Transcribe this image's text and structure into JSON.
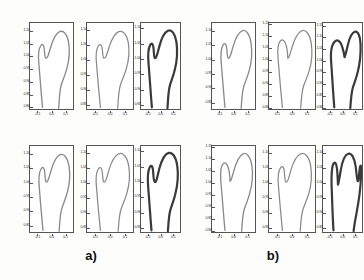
{
  "figure": {
    "type": "scientific-figure",
    "background_color": "#ffffff",
    "axis_color": "#555555"
  },
  "groups": [
    {
      "id": "a",
      "caption": "a)",
      "panels": [
        {
          "id": "a-r1-c1",
          "line_color": "#8a8a8a",
          "line_width": 0.6,
          "xticks": [
            "-0.1",
            "0.0",
            "0.1"
          ],
          "xtick_values": [
            -0.1,
            0.0,
            0.1
          ],
          "yticks": [
            "0.80",
            "0.85",
            "0.90",
            "0.95",
            "1.00",
            "1.05",
            "1.10"
          ],
          "ytick_values": [
            0.8,
            0.85,
            0.9,
            0.95,
            1.0,
            1.05,
            1.1
          ],
          "xlim": [
            -0.16,
            0.16
          ],
          "ylim": [
            0.79,
            1.135
          ],
          "ylabels_side": "left"
        },
        {
          "id": "a-r1-c2",
          "line_color": "#8a8a8a",
          "line_width": 0.6,
          "xticks": [
            "-0.1",
            "0.0",
            "0.1"
          ],
          "xtick_values": [
            -0.1,
            0.0,
            0.1
          ],
          "yticks": [
            "0.85",
            "0.90",
            "0.95",
            "1.00",
            "1.05",
            "1.10"
          ],
          "ytick_values": [
            0.85,
            0.9,
            0.95,
            1.0,
            1.05,
            1.1
          ],
          "xlim": [
            -0.16,
            0.16
          ],
          "ylim": [
            0.835,
            1.125
          ],
          "ylabels_side": "left"
        },
        {
          "id": "a-r1-c3",
          "line_color": "#3a3a3a",
          "line_width": 0.9,
          "xticks": [
            "-0.1",
            "0.0",
            "0.1"
          ],
          "xtick_values": [
            -0.1,
            0.0,
            0.1
          ],
          "yticks": [
            "0.85",
            "0.90",
            "0.95",
            "1.00",
            "1.05",
            "1.10"
          ],
          "ytick_values": [
            0.85,
            0.9,
            0.95,
            1.0,
            1.05,
            1.1
          ],
          "xlim": [
            -0.16,
            0.16
          ],
          "ylim": [
            0.835,
            1.12
          ],
          "ylabels_side": "left"
        },
        {
          "id": "a-r2-c1",
          "line_color": "#8a8a8a",
          "line_width": 0.6,
          "xticks": [
            "-0.1",
            "0.0",
            "0.1"
          ],
          "xtick_values": [
            -0.1,
            0.0,
            0.1
          ],
          "yticks": [
            "0.85",
            "0.90",
            "0.95",
            "1.00",
            "1.05",
            "1.10"
          ],
          "ytick_values": [
            0.85,
            0.9,
            0.95,
            1.0,
            1.05,
            1.1
          ],
          "xlim": [
            -0.16,
            0.16
          ],
          "ylim": [
            0.825,
            1.13
          ],
          "ylabels_side": "left"
        },
        {
          "id": "a-r2-c2",
          "line_color": "#8a8a8a",
          "line_width": 0.6,
          "xticks": [
            "-0.1",
            "0.0",
            "0.1"
          ],
          "xtick_values": [
            -0.1,
            0.0,
            0.1
          ],
          "yticks": [
            "0.85",
            "0.90",
            "0.95",
            "1.00",
            "1.05",
            "1.10"
          ],
          "ytick_values": [
            0.85,
            0.9,
            0.95,
            1.0,
            1.05,
            1.1
          ],
          "xlim": [
            -0.16,
            0.16
          ],
          "ylim": [
            0.835,
            1.125
          ],
          "ylabels_side": "left"
        },
        {
          "id": "a-r2-c3",
          "line_color": "#3a3a3a",
          "line_width": 0.9,
          "xticks": [
            "-0.1",
            "0.0",
            "0.1"
          ],
          "xtick_values": [
            -0.1,
            0.0,
            0.1
          ],
          "yticks": [
            "0.85",
            "0.90",
            "0.95",
            "1.00",
            "1.05",
            "1.10"
          ],
          "ytick_values": [
            0.85,
            0.9,
            0.95,
            1.0,
            1.05,
            1.1
          ],
          "xlim": [
            -0.16,
            0.16
          ],
          "ylim": [
            0.835,
            1.12
          ],
          "ylabels_side": "left"
        }
      ]
    },
    {
      "id": "b",
      "caption": "b)",
      "panels": [
        {
          "id": "b-r1-c1",
          "line_color": "#8a8a8a",
          "line_width": 0.6,
          "xticks": [
            "-0.1",
            "0.0",
            "0.1"
          ],
          "xtick_values": [
            -0.1,
            0.0,
            0.1
          ],
          "yticks": [
            "0.85",
            "0.90",
            "0.95",
            "1.00",
            "1.05",
            "1.10"
          ],
          "ytick_values": [
            0.85,
            0.9,
            0.95,
            1.0,
            1.05,
            1.1
          ],
          "xlim": [
            -0.16,
            0.16
          ],
          "ylim": [
            0.825,
            1.13
          ],
          "ylabels_side": "left"
        },
        {
          "id": "b-r1-c2",
          "line_color": "#8a8a8a",
          "line_width": 0.6,
          "xticks": [
            "-0.1",
            "0.0",
            "0.1"
          ],
          "xtick_values": [
            -0.1,
            0.0,
            0.1
          ],
          "yticks": [
            "0.80",
            "0.85",
            "0.90",
            "0.95",
            "1.00",
            "1.05",
            "1.10",
            "1.15"
          ],
          "ytick_values": [
            0.8,
            0.85,
            0.9,
            0.95,
            1.0,
            1.05,
            1.1,
            1.15
          ],
          "xlim": [
            -0.16,
            0.16
          ],
          "ylim": [
            0.79,
            1.16
          ],
          "ylabels_side": "left"
        },
        {
          "id": "b-r1-c3",
          "line_color": "#3a3a3a",
          "line_width": 0.9,
          "xticks": [
            "-0.1",
            "0.0",
            "0.1"
          ],
          "xtick_values": [
            -0.1,
            0.0,
            0.1
          ],
          "yticks": [
            "0.80",
            "0.85",
            "0.90",
            "0.95",
            "1.00",
            "1.05",
            "1.10",
            "1.15"
          ],
          "ytick_values": [
            0.8,
            0.85,
            0.9,
            0.95,
            1.0,
            1.05,
            1.1,
            1.15
          ],
          "xlim": [
            -0.16,
            0.16
          ],
          "ylim": [
            0.79,
            1.165
          ],
          "ylabels_side": "left"
        },
        {
          "id": "b-r2-c1",
          "line_color": "#8a8a8a",
          "line_width": 0.6,
          "xticks": [
            "-0.1",
            "0.0",
            "0.1"
          ],
          "xtick_values": [
            -0.1,
            0.0,
            0.1
          ],
          "yticks": [
            "0.80",
            "0.85",
            "0.90",
            "0.95",
            "1.00",
            "1.05",
            "1.10",
            "1.15"
          ],
          "ytick_values": [
            0.8,
            0.85,
            0.9,
            0.95,
            1.0,
            1.05,
            1.1,
            1.15
          ],
          "xlim": [
            -0.16,
            0.16
          ],
          "ylim": [
            0.79,
            1.16
          ],
          "ylabels_side": "left"
        },
        {
          "id": "b-r2-c2",
          "line_color": "#8a8a8a",
          "line_width": 0.6,
          "xticks": [
            "-0.1",
            "0.0",
            "0.1"
          ],
          "xtick_values": [
            -0.1,
            0.0,
            0.1
          ],
          "yticks": [
            "0.85",
            "0.90",
            "0.95",
            "1.00",
            "1.05",
            "1.10"
          ],
          "ytick_values": [
            0.85,
            0.9,
            0.95,
            1.0,
            1.05,
            1.1
          ],
          "xlim": [
            -0.16,
            0.16
          ],
          "ylim": [
            0.835,
            1.125
          ],
          "ylabels_side": "left"
        },
        {
          "id": "b-r2-c3",
          "line_color": "#3a3a3a",
          "line_width": 0.9,
          "xticks": [
            "-0.1",
            "0.0",
            "0.1"
          ],
          "xtick_values": [
            -0.1,
            0.0,
            0.1
          ],
          "yticks": [
            "0.85",
            "0.90",
            "0.95",
            "1.00",
            "1.05",
            "1.10"
          ],
          "ytick_values": [
            0.85,
            0.9,
            0.95,
            1.0,
            1.05,
            1.1
          ],
          "xlim": [
            -0.16,
            0.16
          ],
          "ylim": [
            0.835,
            1.125
          ],
          "ylabels_side": "left"
        }
      ]
    }
  ],
  "chart_data": {
    "type": "line",
    "title": "",
    "xlabel": "",
    "ylabel": "",
    "grid": false,
    "legend": "none",
    "note": "Each subplot draws a single closed/open 2D contour of a proximal femur outline in normalized coordinates.",
    "contours": {
      "a-r1-c1": {
        "x": [
          -0.052,
          -0.07,
          -0.082,
          -0.088,
          -0.084,
          -0.072,
          -0.058,
          -0.048,
          -0.044,
          -0.046,
          -0.038,
          -0.02,
          0.0,
          0.018,
          0.034,
          0.048,
          0.06,
          0.07,
          0.078,
          0.082,
          0.08,
          0.072,
          0.062,
          0.056,
          0.052,
          0.052,
          0.056,
          0.058,
          0.058,
          0.054,
          0.048,
          0.04,
          0.032,
          0.026,
          0.022,
          0.02,
          0.02
        ],
        "y": [
          1.09,
          1.085,
          1.073,
          1.058,
          1.046,
          1.04,
          1.044,
          1.052,
          1.064,
          1.078,
          1.092,
          1.104,
          1.112,
          1.116,
          1.115,
          1.11,
          1.1,
          1.086,
          1.068,
          1.048,
          1.03,
          1.014,
          1.002,
          0.994,
          0.984,
          0.972,
          0.958,
          0.942,
          0.924,
          0.906,
          0.89,
          0.874,
          0.858,
          0.844,
          0.832,
          0.822,
          0.812
        ],
        "x2": [
          -0.052,
          -0.058,
          -0.064,
          -0.068,
          -0.07,
          -0.07,
          -0.068,
          -0.066,
          -0.064,
          -0.062,
          -0.06,
          -0.058,
          -0.056,
          -0.054,
          -0.052,
          -0.05
        ],
        "y2": [
          1.09,
          1.072,
          1.052,
          1.03,
          1.008,
          0.986,
          0.964,
          0.942,
          0.92,
          0.898,
          0.876,
          0.856,
          0.838,
          0.822,
          0.81,
          0.8
        ]
      },
      "a-r1-c2": {
        "shape": "femur-outline",
        "variant": "mean"
      },
      "a-r1-c3": {
        "shape": "femur-outline",
        "variant": "mean-bold"
      },
      "a-r2-c1": {
        "shape": "femur-outline",
        "variant": "mode-low"
      },
      "a-r2-c2": {
        "shape": "femur-outline",
        "variant": "mode-mid"
      },
      "a-r2-c3": {
        "shape": "femur-outline",
        "variant": "mode-high-bold"
      },
      "b-r1-c1": {
        "shape": "femur-outline",
        "variant": "b-mean"
      },
      "b-r1-c2": {
        "shape": "femur-outline",
        "variant": "b-mid"
      },
      "b-r1-c3": {
        "shape": "femur-outline",
        "variant": "b-round-head-bold"
      },
      "b-r2-c1": {
        "shape": "femur-outline",
        "variant": "b-mode-low"
      },
      "b-r2-c2": {
        "shape": "femur-outline",
        "variant": "b-mode-mid"
      },
      "b-r2-c3": {
        "shape": "femur-outline",
        "variant": "b-notched-bold"
      }
    }
  }
}
